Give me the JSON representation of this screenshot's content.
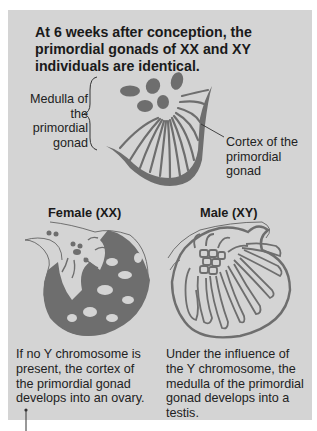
{
  "title": "At 6 weeks after conception, the primordial gonads of XX and XY individuals are identical.",
  "primordial": {
    "medulla_label": "Medulla of the primordial gonad",
    "cortex_label": "Cortex of the primordial gonad"
  },
  "female": {
    "heading": "Female (XX)",
    "caption": "If no Y chromosome is present, the cortex of the primordial gonad develops into an ovary."
  },
  "male": {
    "heading": "Male (XY)",
    "caption": "Under the influence of the Y chromosome, the medulla of the primordial gonad develops into a testis."
  },
  "colors": {
    "panel": "#d4d4d4",
    "tissue": "#6e6e6e",
    "text": "#1a1a1a"
  }
}
